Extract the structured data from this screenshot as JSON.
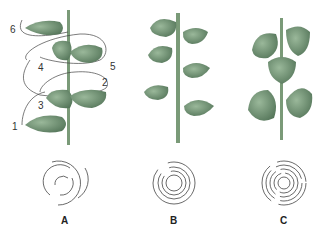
{
  "figure": {
    "panels": [
      {
        "label": "A",
        "arrangement": "alternate / spiral",
        "leaf_sequence": [
          "1",
          "2",
          "3",
          "4",
          "5",
          "6"
        ]
      },
      {
        "label": "B",
        "arrangement": "opposite"
      },
      {
        "label": "C",
        "arrangement": "whorled"
      }
    ],
    "sequence_numbers": [
      "1",
      "2",
      "3",
      "4",
      "5",
      "6"
    ],
    "colors": {
      "stem": "#7a9a78",
      "leaf": "#6f9171",
      "leaf_dark": "#54745a",
      "line": "#444444"
    }
  }
}
